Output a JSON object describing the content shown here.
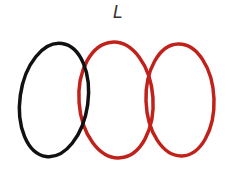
{
  "label": "L",
  "shapes": [
    {
      "name": "oval-1",
      "color": "#111111"
    },
    {
      "name": "oval-2",
      "color": "#c0221b"
    },
    {
      "name": "oval-3",
      "color": "#c0221b"
    }
  ]
}
